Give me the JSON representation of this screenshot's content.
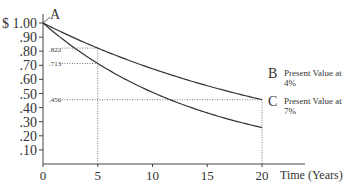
{
  "chart_data": {
    "type": "line",
    "title": "",
    "xlabel": "Time (Years)",
    "ylabel": "$",
    "xlim": [
      0,
      20
    ],
    "ylim": [
      0,
      1.0
    ],
    "x_ticks": [
      0,
      5,
      10,
      15,
      20
    ],
    "y_ticks": [
      "$ 1.00",
      ".90",
      ".80",
      ".70",
      ".60",
      ".50",
      ".40",
      ".30",
      ".20",
      ".10"
    ],
    "series": [
      {
        "name": "Present Value at 4%",
        "end_label": "B",
        "rate": 0.04,
        "x": [
          0,
          5,
          10,
          15,
          20
        ],
        "values": [
          1.0,
          0.822,
          0.676,
          0.555,
          0.456
        ]
      },
      {
        "name": "Present Value at 7%",
        "end_label": "C",
        "rate": 0.07,
        "x": [
          0,
          5,
          10,
          15,
          20
        ],
        "values": [
          1.0,
          0.713,
          0.508,
          0.362,
          0.258
        ]
      }
    ],
    "start_label": "A",
    "annotations": [
      ".822",
      ".713",
      ".456"
    ],
    "grid": false,
    "guide_lines": "dotted lines at x=5 and x=20 to curves and y-axis"
  },
  "labels": {
    "a": "A",
    "b": "B",
    "c": "C",
    "b_text_1": "Present Value at",
    "b_text_2": "4%",
    "c_text_1": "Present Value at",
    "c_text_2": "7%",
    "xaxis": "Time (Years)",
    "ann_822": ".822",
    "ann_713": ".713",
    "ann_456": ".456"
  }
}
